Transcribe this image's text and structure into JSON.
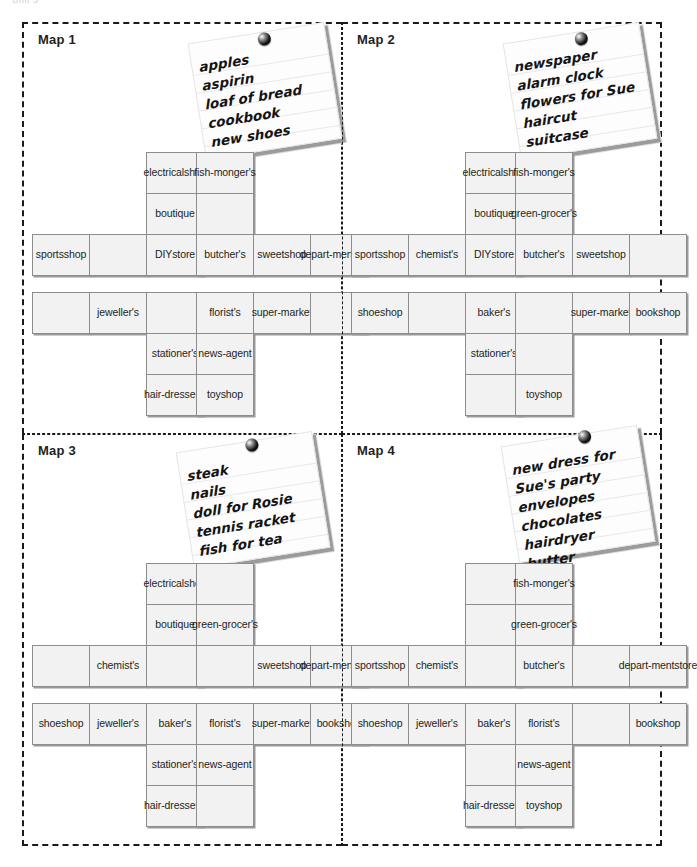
{
  "page": {
    "top_fragment": "Unit 3",
    "cell_label_empty": ""
  },
  "panels": [
    {
      "id": "map-1",
      "title": "Map 1",
      "note": {
        "pin": "pushpin-icon",
        "items": [
          "apples",
          "aspirin",
          "loaf of bread",
          "cookbook",
          "new shoes"
        ]
      },
      "blocks": [
        {
          "id": "map1-block-top-left",
          "rows": [
            [
              {
                "label": "",
                "type": "spacer"
              },
              {
                "label": "",
                "type": "spacer"
              },
              {
                "label": "electrical shop"
              }
            ],
            [
              {
                "label": "",
                "type": "spacer"
              },
              {
                "label": "",
                "type": "spacer"
              },
              {
                "label": "boutique"
              }
            ],
            [
              {
                "label": "sports shop"
              },
              {
                "label": ""
              },
              {
                "label": "DIY store"
              }
            ]
          ]
        },
        {
          "id": "map1-block-top-right",
          "rows": [
            [
              {
                "label": "fish- monger's"
              },
              {
                "label": "",
                "type": "spacer"
              },
              {
                "label": "",
                "type": "spacer"
              }
            ],
            [
              {
                "label": ""
              },
              {
                "label": "",
                "type": "spacer"
              },
              {
                "label": "",
                "type": "spacer"
              }
            ],
            [
              {
                "label": "butcher's"
              },
              {
                "label": "sweet shop"
              },
              {
                "label": "depart- ment store"
              }
            ]
          ]
        },
        {
          "id": "map1-block-bottom-left",
          "rows": [
            [
              {
                "label": ""
              },
              {
                "label": "jeweller's"
              },
              {
                "label": ""
              }
            ],
            [
              {
                "label": "",
                "type": "spacer"
              },
              {
                "label": "",
                "type": "spacer"
              },
              {
                "label": "stationer's"
              }
            ],
            [
              {
                "label": "",
                "type": "spacer"
              },
              {
                "label": "",
                "type": "spacer"
              },
              {
                "label": "hair- dresser's"
              }
            ]
          ]
        },
        {
          "id": "map1-block-bottom-right",
          "rows": [
            [
              {
                "label": "florist's"
              },
              {
                "label": "super- market"
              },
              {
                "label": ""
              }
            ],
            [
              {
                "label": "news- agent"
              },
              {
                "label": "",
                "type": "spacer"
              },
              {
                "label": "",
                "type": "spacer"
              }
            ],
            [
              {
                "label": "toy shop"
              },
              {
                "label": "",
                "type": "spacer"
              },
              {
                "label": "",
                "type": "spacer"
              }
            ]
          ]
        }
      ]
    },
    {
      "id": "map-2",
      "title": "Map 2",
      "note": {
        "pin": "pushpin-icon",
        "items": [
          "newspaper",
          "alarm clock",
          "flowers for Sue",
          "haircut",
          "suitcase"
        ]
      },
      "blocks": [
        {
          "id": "map2-block-top-left",
          "rows": [
            [
              {
                "label": "",
                "type": "spacer"
              },
              {
                "label": "",
                "type": "spacer"
              },
              {
                "label": "electrical shop"
              }
            ],
            [
              {
                "label": "",
                "type": "spacer"
              },
              {
                "label": "",
                "type": "spacer"
              },
              {
                "label": "boutique"
              }
            ],
            [
              {
                "label": "sports shop"
              },
              {
                "label": "chemist's"
              },
              {
                "label": "DIY store"
              }
            ]
          ]
        },
        {
          "id": "map2-block-top-right",
          "rows": [
            [
              {
                "label": "fish- monger's"
              },
              {
                "label": "",
                "type": "spacer"
              },
              {
                "label": "",
                "type": "spacer"
              }
            ],
            [
              {
                "label": "green- grocer's"
              },
              {
                "label": "",
                "type": "spacer"
              },
              {
                "label": "",
                "type": "spacer"
              }
            ],
            [
              {
                "label": "butcher's"
              },
              {
                "label": "sweet shop"
              },
              {
                "label": ""
              }
            ]
          ]
        },
        {
          "id": "map2-block-bottom-left",
          "rows": [
            [
              {
                "label": "shoe shop"
              },
              {
                "label": ""
              },
              {
                "label": "baker's"
              }
            ],
            [
              {
                "label": "",
                "type": "spacer"
              },
              {
                "label": "",
                "type": "spacer"
              },
              {
                "label": "stationer's"
              }
            ],
            [
              {
                "label": "",
                "type": "spacer"
              },
              {
                "label": "",
                "type": "spacer"
              },
              {
                "label": ""
              }
            ]
          ]
        },
        {
          "id": "map2-block-bottom-right",
          "rows": [
            [
              {
                "label": ""
              },
              {
                "label": "super- market"
              },
              {
                "label": "bookshop"
              }
            ],
            [
              {
                "label": ""
              },
              {
                "label": "",
                "type": "spacer"
              },
              {
                "label": "",
                "type": "spacer"
              }
            ],
            [
              {
                "label": "toy shop"
              },
              {
                "label": "",
                "type": "spacer"
              },
              {
                "label": "",
                "type": "spacer"
              }
            ]
          ]
        }
      ]
    },
    {
      "id": "map-3",
      "title": "Map 3",
      "note": {
        "pin": "pushpin-icon",
        "items": [
          "steak",
          "nails",
          "doll for Rosie",
          "tennis racket",
          "fish for tea"
        ]
      },
      "blocks": [
        {
          "id": "map3-block-top-left",
          "rows": [
            [
              {
                "label": "",
                "type": "spacer"
              },
              {
                "label": "",
                "type": "spacer"
              },
              {
                "label": "electrical shop"
              }
            ],
            [
              {
                "label": "",
                "type": "spacer"
              },
              {
                "label": "",
                "type": "spacer"
              },
              {
                "label": "boutique"
              }
            ],
            [
              {
                "label": ""
              },
              {
                "label": "chemist's"
              },
              {
                "label": ""
              }
            ]
          ]
        },
        {
          "id": "map3-block-top-right",
          "rows": [
            [
              {
                "label": ""
              },
              {
                "label": "",
                "type": "spacer"
              },
              {
                "label": "",
                "type": "spacer"
              }
            ],
            [
              {
                "label": "green- grocer's"
              },
              {
                "label": "",
                "type": "spacer"
              },
              {
                "label": "",
                "type": "spacer"
              }
            ],
            [
              {
                "label": ""
              },
              {
                "label": "sweet shop"
              },
              {
                "label": "depart- ment store"
              }
            ]
          ]
        },
        {
          "id": "map3-block-bottom-left",
          "rows": [
            [
              {
                "label": "shoe shop"
              },
              {
                "label": "jeweller's"
              },
              {
                "label": "baker's"
              }
            ],
            [
              {
                "label": "",
                "type": "spacer"
              },
              {
                "label": "",
                "type": "spacer"
              },
              {
                "label": "stationer's"
              }
            ],
            [
              {
                "label": "",
                "type": "spacer"
              },
              {
                "label": "",
                "type": "spacer"
              },
              {
                "label": "hair- dresser's"
              }
            ]
          ]
        },
        {
          "id": "map3-block-bottom-right",
          "rows": [
            [
              {
                "label": "florist's"
              },
              {
                "label": "super- market"
              },
              {
                "label": "bookshop"
              }
            ],
            [
              {
                "label": "news- agent"
              },
              {
                "label": "",
                "type": "spacer"
              },
              {
                "label": "",
                "type": "spacer"
              }
            ],
            [
              {
                "label": ""
              },
              {
                "label": "",
                "type": "spacer"
              },
              {
                "label": "",
                "type": "spacer"
              }
            ]
          ]
        }
      ]
    },
    {
      "id": "map-4",
      "title": "Map 4",
      "note": {
        "pin": "pushpin-icon",
        "items": [
          "new dress for",
          "Sue's party",
          "envelopes",
          "chocolates",
          "hairdryer",
          "butter"
        ]
      },
      "blocks": [
        {
          "id": "map4-block-top-left",
          "rows": [
            [
              {
                "label": "",
                "type": "spacer"
              },
              {
                "label": "",
                "type": "spacer"
              },
              {
                "label": ""
              }
            ],
            [
              {
                "label": "",
                "type": "spacer"
              },
              {
                "label": "",
                "type": "spacer"
              },
              {
                "label": ""
              }
            ],
            [
              {
                "label": "sports shop"
              },
              {
                "label": "chemist's"
              },
              {
                "label": ""
              }
            ]
          ]
        },
        {
          "id": "map4-block-top-right",
          "rows": [
            [
              {
                "label": "fish- monger's"
              },
              {
                "label": "",
                "type": "spacer"
              },
              {
                "label": "",
                "type": "spacer"
              }
            ],
            [
              {
                "label": "green- grocer's"
              },
              {
                "label": "",
                "type": "spacer"
              },
              {
                "label": "",
                "type": "spacer"
              }
            ],
            [
              {
                "label": "butcher's"
              },
              {
                "label": ""
              },
              {
                "label": "depart- ment store"
              }
            ]
          ]
        },
        {
          "id": "map4-block-bottom-left",
          "rows": [
            [
              {
                "label": "shoe shop"
              },
              {
                "label": "jeweller's"
              },
              {
                "label": "baker's"
              }
            ],
            [
              {
                "label": "",
                "type": "spacer"
              },
              {
                "label": "",
                "type": "spacer"
              },
              {
                "label": ""
              }
            ],
            [
              {
                "label": "",
                "type": "spacer"
              },
              {
                "label": "",
                "type": "spacer"
              },
              {
                "label": "hair- dresser's"
              }
            ]
          ]
        },
        {
          "id": "map4-block-bottom-right",
          "rows": [
            [
              {
                "label": "florist's"
              },
              {
                "label": ""
              },
              {
                "label": "bookshop"
              }
            ],
            [
              {
                "label": "news- agent"
              },
              {
                "label": "",
                "type": "spacer"
              },
              {
                "label": "",
                "type": "spacer"
              }
            ],
            [
              {
                "label": "toy shop"
              },
              {
                "label": "",
                "type": "spacer"
              },
              {
                "label": "",
                "type": "spacer"
              }
            ]
          ]
        }
      ]
    }
  ],
  "layout": {
    "note_positions": [
      {
        "left": 172,
        "top": 8,
        "rotate": -9,
        "pin_left": 70,
        "pin_top": 1
      },
      {
        "left": 168,
        "top": 8,
        "rotate": -9,
        "pin_left": 72,
        "pin_top": 1
      },
      {
        "left": 160,
        "top": 6,
        "rotate": -9,
        "pin_left": 70,
        "pin_top": -2
      },
      {
        "left": 166,
        "top": 0,
        "rotate": -9,
        "pin_left": 78,
        "pin_top": -3
      }
    ],
    "block_positions": [
      {
        "left": 8,
        "top": 128
      },
      {
        "left": 172,
        "top": 128
      },
      {
        "left": 8,
        "top": 268
      },
      {
        "left": 172,
        "top": 268
      }
    ]
  },
  "colors": {
    "cell_fill": "#f2f2f2",
    "cell_stroke": "#8d8d8d",
    "cell_shadow": "#9a9a9a",
    "panel_border": "#1a1a1a",
    "text": "#231f20"
  }
}
